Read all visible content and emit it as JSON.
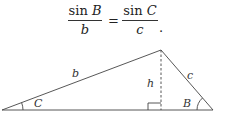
{
  "formula": {
    "left": {
      "func": "sin",
      "numerator_var": "B",
      "denominator": "b"
    },
    "equals": "=",
    "right": {
      "func": "sin",
      "numerator_var": "C",
      "denominator": "c"
    },
    "trailing": "."
  },
  "triangle": {
    "side_labels": {
      "b": "b",
      "c": "c",
      "h": "h"
    },
    "angle_labels": {
      "C": "C",
      "B": "B"
    },
    "line_color": "#444444",
    "altitude_style": "dashed"
  }
}
